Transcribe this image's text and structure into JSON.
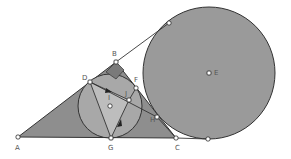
{
  "diagram": {
    "type": "geometry-construction",
    "colors": {
      "triangle_fill": "#8e8e8e",
      "excircle_fill": "#9a9a9a",
      "incircle_fill": "#a8a8a8",
      "inner_triangle_fill": "#bdbdbd",
      "stroke": "#333333",
      "point_fill": "#ffffff"
    },
    "points": {
      "A": {
        "label": "A",
        "x": 18,
        "y": 137
      },
      "B": {
        "label": "B",
        "x": 116,
        "y": 62
      },
      "C": {
        "label": "C",
        "x": 176,
        "y": 138
      },
      "D": {
        "label": "D",
        "x": 90,
        "y": 82
      },
      "E": {
        "label": "E",
        "x": 209,
        "y": 73
      },
      "F": {
        "label": "F",
        "x": 136,
        "y": 88
      },
      "G": {
        "label": "G",
        "x": 111,
        "y": 138
      },
      "H": {
        "label": "H",
        "x": 157,
        "y": 117
      },
      "I": {
        "label": "I",
        "x": 110,
        "y": 106
      },
      "J": {
        "label": "J",
        "x": 129,
        "y": 100
      },
      "T1": {
        "label": "",
        "x": 169,
        "y": 23
      },
      "T2": {
        "label": "",
        "x": 208,
        "y": 139
      }
    },
    "circles": [
      {
        "name": "incircle",
        "center": "I",
        "r": 32
      },
      {
        "name": "excircle",
        "center": "E",
        "r": 66
      }
    ]
  }
}
